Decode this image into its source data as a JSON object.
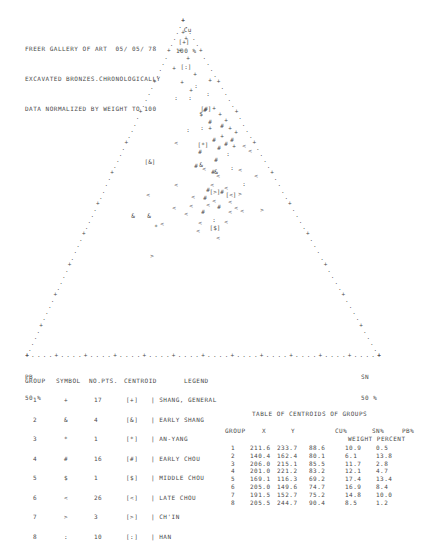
{
  "header": {
    "lines": [
      "FREER GALLERY OF ART  05/ 05/ 78",
      "EXCAVATED BRONZES.CHRONOLOGICALLY",
      "DATA NORMALIZED BY WEIGHT TO 100"
    ]
  },
  "chart_data": {
    "type": "scatter",
    "subtype": "ternary",
    "apex_labels": {
      "top": {
        "element": "Cu",
        "value": "100 %"
      },
      "bottom_left": {
        "element": "PB",
        "value": "50 %"
      },
      "bottom_right": {
        "element": "SN",
        "value": "50 %"
      }
    },
    "triangle": {
      "apex": [
        183,
        20
      ],
      "left": [
        27,
        355
      ],
      "right": [
        379,
        355
      ]
    },
    "grid": false,
    "points": [
      {
        "g": 1,
        "s": "+",
        "x": 183,
        "y": 34
      },
      {
        "g": 1,
        "s": "+",
        "x": 186,
        "y": 40
      },
      {
        "g": 1,
        "s": "+",
        "x": 180,
        "y": 52
      },
      {
        "g": 1,
        "s": "+",
        "x": 188,
        "y": 60
      },
      {
        "g": 1,
        "s": "+",
        "x": 174,
        "y": 70
      },
      {
        "g": 1,
        "s": "+",
        "x": 195,
        "y": 76
      },
      {
        "g": 1,
        "s": "+",
        "x": 182,
        "y": 84
      },
      {
        "g": 1,
        "s": "+",
        "x": 191,
        "y": 92
      },
      {
        "g": 1,
        "s": "+",
        "x": 210,
        "y": 82
      },
      {
        "g": 1,
        "s": "+",
        "x": 214,
        "y": 110
      },
      {
        "g": 1,
        "s": "+",
        "x": 220,
        "y": 116
      },
      {
        "g": 1,
        "s": "+",
        "x": 226,
        "y": 122
      },
      {
        "g": 1,
        "s": "+",
        "x": 230,
        "y": 130
      },
      {
        "g": 1,
        "s": "+",
        "x": 236,
        "y": 134
      },
      {
        "g": 1,
        "s": "+",
        "x": 234,
        "y": 148
      },
      {
        "g": 1,
        "s": "+",
        "x": 210,
        "y": 130
      },
      {
        "g": 1,
        "s": "+",
        "x": 222,
        "y": 138
      },
      {
        "g": 2,
        "s": "&",
        "x": 133,
        "y": 218
      },
      {
        "g": 2,
        "s": "&",
        "x": 149,
        "y": 218
      },
      {
        "g": 2,
        "s": "&",
        "x": 201,
        "y": 167
      },
      {
        "g": 2,
        "s": "&",
        "x": 216,
        "y": 174
      },
      {
        "g": 3,
        "s": "*",
        "x": 156,
        "y": 229
      },
      {
        "g": 4,
        "s": "#",
        "x": 205,
        "y": 112
      },
      {
        "g": 4,
        "s": "#",
        "x": 210,
        "y": 124
      },
      {
        "g": 4,
        "s": "#",
        "x": 214,
        "y": 142
      },
      {
        "g": 4,
        "s": "#",
        "x": 222,
        "y": 128
      },
      {
        "g": 4,
        "s": "#",
        "x": 226,
        "y": 146
      },
      {
        "g": 4,
        "s": "#",
        "x": 232,
        "y": 142
      },
      {
        "g": 4,
        "s": "#",
        "x": 219,
        "y": 150
      },
      {
        "g": 4,
        "s": "#",
        "x": 216,
        "y": 162
      },
      {
        "g": 4,
        "s": "#",
        "x": 213,
        "y": 174
      },
      {
        "g": 4,
        "s": "#",
        "x": 200,
        "y": 154
      },
      {
        "g": 4,
        "s": "#",
        "x": 196,
        "y": 168
      },
      {
        "g": 4,
        "s": "#",
        "x": 208,
        "y": 192
      },
      {
        "g": 4,
        "s": "#",
        "x": 205,
        "y": 200
      },
      {
        "g": 4,
        "s": "#",
        "x": 203,
        "y": 214
      },
      {
        "g": 4,
        "s": "#",
        "x": 222,
        "y": 194
      },
      {
        "g": 4,
        "s": "#",
        "x": 219,
        "y": 209
      },
      {
        "g": 5,
        "s": "$",
        "x": 201,
        "y": 116
      },
      {
        "g": 6,
        "s": "<",
        "x": 204,
        "y": 171
      },
      {
        "g": 6,
        "s": "<",
        "x": 218,
        "y": 178
      },
      {
        "g": 6,
        "s": "<",
        "x": 212,
        "y": 187
      },
      {
        "g": 6,
        "s": "<",
        "x": 226,
        "y": 190
      },
      {
        "g": 6,
        "s": "<",
        "x": 214,
        "y": 203
      },
      {
        "g": 6,
        "s": "<",
        "x": 230,
        "y": 204
      },
      {
        "g": 6,
        "s": "<",
        "x": 176,
        "y": 187
      },
      {
        "g": 6,
        "s": "<",
        "x": 193,
        "y": 199
      },
      {
        "g": 6,
        "s": "<",
        "x": 174,
        "y": 210
      },
      {
        "g": 6,
        "s": "<",
        "x": 191,
        "y": 208
      },
      {
        "g": 6,
        "s": "<",
        "x": 186,
        "y": 216
      },
      {
        "g": 6,
        "s": "<",
        "x": 148,
        "y": 197
      },
      {
        "g": 6,
        "s": "<",
        "x": 162,
        "y": 226
      },
      {
        "g": 6,
        "s": "<",
        "x": 198,
        "y": 233
      },
      {
        "g": 6,
        "s": "<",
        "x": 226,
        "y": 224
      },
      {
        "g": 6,
        "s": "<",
        "x": 218,
        "y": 240
      },
      {
        "g": 6,
        "s": "<",
        "x": 242,
        "y": 213
      },
      {
        "g": 6,
        "s": "<",
        "x": 240,
        "y": 172
      },
      {
        "g": 6,
        "s": "<",
        "x": 256,
        "y": 178
      },
      {
        "g": 6,
        "s": "<",
        "x": 250,
        "y": 153
      },
      {
        "g": 6,
        "s": "<",
        "x": 236,
        "y": 210
      },
      {
        "g": 6,
        "s": "<",
        "x": 208,
        "y": 207
      },
      {
        "g": 6,
        "s": "<",
        "x": 200,
        "y": 225
      },
      {
        "g": 6,
        "s": "<",
        "x": 230,
        "y": 214
      },
      {
        "g": 6,
        "s": "<",
        "x": 244,
        "y": 148
      },
      {
        "g": 6,
        "s": "<",
        "x": 176,
        "y": 145
      },
      {
        "g": 7,
        "s": ">",
        "x": 152,
        "y": 258
      },
      {
        "g": 7,
        "s": ">",
        "x": 262,
        "y": 212
      },
      {
        "g": 7,
        "s": ">",
        "x": 240,
        "y": 196
      },
      {
        "g": 8,
        "s": ":",
        "x": 196,
        "y": 88
      },
      {
        "g": 8,
        "s": ":",
        "x": 190,
        "y": 100
      },
      {
        "g": 8,
        "s": ":",
        "x": 208,
        "y": 96
      },
      {
        "g": 8,
        "s": ":",
        "x": 176,
        "y": 100
      },
      {
        "g": 8,
        "s": ":",
        "x": 202,
        "y": 130
      },
      {
        "g": 8,
        "s": ":",
        "x": 228,
        "y": 156
      },
      {
        "g": 8,
        "s": ":",
        "x": 232,
        "y": 170
      },
      {
        "g": 8,
        "s": ":",
        "x": 244,
        "y": 186
      },
      {
        "g": 8,
        "s": ":",
        "x": 214,
        "y": 222
      },
      {
        "g": 8,
        "s": ":",
        "x": 188,
        "y": 132
      }
    ],
    "centroids": [
      {
        "g": 1,
        "label": "[+]",
        "x": 184,
        "y": 44
      },
      {
        "g": 2,
        "label": "[&]",
        "x": 150,
        "y": 164
      },
      {
        "g": 3,
        "label": "[*]",
        "x": 203,
        "y": 147
      },
      {
        "g": 4,
        "label": "[#]",
        "x": 206,
        "y": 111
      },
      {
        "g": 5,
        "label": "[$]",
        "x": 215,
        "y": 230
      },
      {
        "g": 6,
        "label": "[<]",
        "x": 231,
        "y": 197
      },
      {
        "g": 7,
        "label": "[>]",
        "x": 215,
        "y": 194
      },
      {
        "g": 8,
        "label": "[:]",
        "x": 186,
        "y": 69
      }
    ]
  },
  "legend": {
    "headers": [
      "GROUP",
      "SYMBOL",
      "NO.PTS.",
      "CENTROID",
      "LEGEND"
    ],
    "rows": [
      {
        "group": "1",
        "symbol": "+",
        "npts": "17",
        "centroid": "[+]",
        "legend": "| SHANG, GENERAL"
      },
      {
        "group": "2",
        "symbol": "&",
        "npts": "4",
        "centroid": "[&]",
        "legend": "| EARLY SHANG"
      },
      {
        "group": "3",
        "symbol": "*",
        "npts": "1",
        "centroid": "[*]",
        "legend": "| AN-YANG"
      },
      {
        "group": "4",
        "symbol": "#",
        "npts": "16",
        "centroid": "[#]",
        "legend": "| EARLY CHOU"
      },
      {
        "group": "5",
        "symbol": "$",
        "npts": "1",
        "centroid": "[$]",
        "legend": "| MIDDLE CHOU"
      },
      {
        "group": "6",
        "symbol": "<",
        "npts": "26",
        "centroid": "[<]",
        "legend": "| LATE CHOU"
      },
      {
        "group": "7",
        "symbol": ">",
        "npts": "3",
        "centroid": "[>]",
        "legend": "| CH'IN"
      },
      {
        "group": "8",
        "symbol": ":",
        "npts": "10",
        "centroid": "[:]",
        "legend": "| HAN"
      }
    ]
  },
  "centroid_table": {
    "title": "TABLE OF CENTROIDS OF GROUPS",
    "headers": [
      "GROUP",
      "X",
      "Y",
      "CU%",
      "SN%",
      "PB%"
    ],
    "subheader": "WEIGHT PERCENT",
    "rows": [
      {
        "group": "1",
        "x": "211.6",
        "y": "233.7",
        "cu": "88.6",
        "sn": "10.9",
        "pb": "0.5"
      },
      {
        "group": "2",
        "x": "140.4",
        "y": "162.4",
        "cu": "80.1",
        "sn": "6.1",
        "pb": "13.8"
      },
      {
        "group": "3",
        "x": "206.0",
        "y": "215.1",
        "cu": "85.5",
        "sn": "11.7",
        "pb": "2.8"
      },
      {
        "group": "4",
        "x": "201.0",
        "y": "221.2",
        "cu": "83.2",
        "sn": "12.1",
        "pb": "4.7"
      },
      {
        "group": "5",
        "x": "169.1",
        "y": "116.3",
        "cu": "69.2",
        "sn": "17.4",
        "pb": "13.4"
      },
      {
        "group": "6",
        "x": "205.0",
        "y": "149.6",
        "cu": "74.7",
        "sn": "16.9",
        "pb": "8.4"
      },
      {
        "group": "7",
        "x": "191.5",
        "y": "152.7",
        "cu": "75.2",
        "sn": "14.8",
        "pb": "10.0"
      },
      {
        "group": "8",
        "x": "205.5",
        "y": "244.7",
        "cu": "90.4",
        "sn": "8.5",
        "pb": "1.2"
      }
    ]
  },
  "colors": {
    "ink": "#4a4a4a",
    "paper": "#ffffff"
  }
}
